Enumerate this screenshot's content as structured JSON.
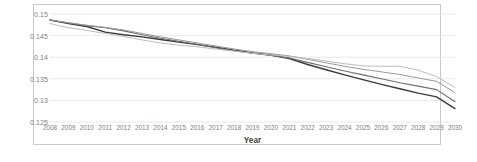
{
  "chart_data": {
    "type": "line",
    "title": "",
    "xlabel": "Year",
    "ylabel": "",
    "grid": true,
    "legend": "none",
    "xlim": [
      2008,
      2030
    ],
    "ylim": [
      0.125,
      0.15
    ],
    "yticks": [
      "0.15",
      "0.145",
      "0.14",
      "0.135",
      "0.13",
      "0.125"
    ],
    "ytick_values": [
      0.15,
      0.145,
      0.14,
      0.135,
      0.13,
      0.125
    ],
    "categories": [
      2008,
      2009,
      2010,
      2011,
      2012,
      2013,
      2014,
      2015,
      2016,
      2017,
      2018,
      2019,
      2020,
      2021,
      2022,
      2023,
      2024,
      2025,
      2026,
      2027,
      2028,
      2029,
      2030
    ],
    "xtick_labels": [
      "2008",
      "2009",
      "2010",
      "2011",
      "2012",
      "2013",
      "2014",
      "2015",
      "2016",
      "2017",
      "2018",
      "2019",
      "2020",
      "2021",
      "2022",
      "2023",
      "2024",
      "2025",
      "2026",
      "2027",
      "2028",
      "2029",
      "2030"
    ],
    "series": [
      {
        "name": "Series 1",
        "color": "#3a3a3a",
        "width": 1.4,
        "values": [
          0.1486,
          0.1478,
          0.1471,
          0.1458,
          0.1452,
          0.1447,
          0.1441,
          0.1435,
          0.1429,
          0.1423,
          0.1416,
          0.141,
          0.1405,
          0.1397,
          0.1383,
          0.1371,
          0.1359,
          0.1348,
          0.1337,
          0.1327,
          0.1317,
          0.1308,
          0.1281
        ]
      },
      {
        "name": "Series 2",
        "color": "#6e6e6e",
        "width": 1.1,
        "values": [
          0.1486,
          0.1479,
          0.1473,
          0.1468,
          0.1461,
          0.1452,
          0.1444,
          0.1437,
          0.143,
          0.1422,
          0.1415,
          0.1409,
          0.1404,
          0.1398,
          0.1388,
          0.1378,
          0.1368,
          0.1359,
          0.135,
          0.1341,
          0.1333,
          0.1325,
          0.1297
        ]
      },
      {
        "name": "Series 3",
        "color": "#9a9a9a",
        "width": 1.0,
        "values": [
          0.1486,
          0.148,
          0.1474,
          0.1469,
          0.1463,
          0.1455,
          0.1447,
          0.144,
          0.1433,
          0.1426,
          0.1419,
          0.1413,
          0.1408,
          0.1403,
          0.1395,
          0.1387,
          0.1379,
          0.1372,
          0.1366,
          0.136,
          0.1352,
          0.1344,
          0.1318
        ]
      },
      {
        "name": "Series 4",
        "color": "#bcbcbc",
        "width": 1.0,
        "values": [
          0.1478,
          0.1468,
          0.1462,
          0.1455,
          0.1448,
          0.144,
          0.1433,
          0.1428,
          0.1424,
          0.1419,
          0.1414,
          0.1409,
          0.1405,
          0.1402,
          0.1397,
          0.1391,
          0.1385,
          0.138,
          0.1379,
          0.1379,
          0.137,
          0.1355,
          0.133
        ]
      }
    ]
  },
  "axis": {
    "x_title": "Year"
  }
}
